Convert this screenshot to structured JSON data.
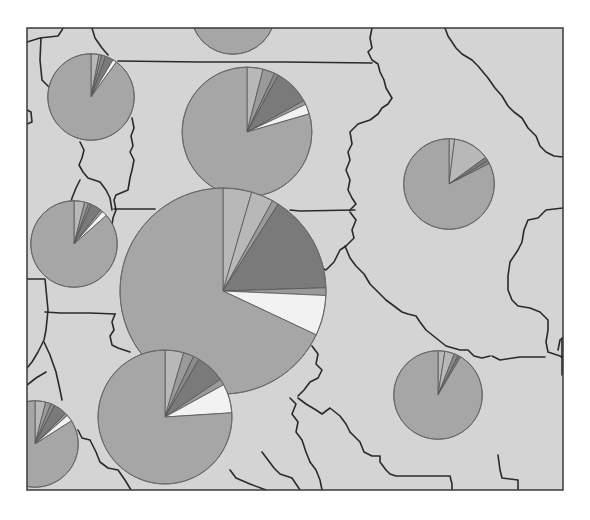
{
  "map": {
    "title": "",
    "background_color": "#d4d4d4",
    "border_color": "#2a2a2a"
  },
  "chart_data": {
    "type": "pie",
    "title": "",
    "legend": [],
    "category_colors": {
      "dominant": "#a6a6a6",
      "light": "#b8b8b8",
      "medium": "#9a9a9a",
      "dark": "#8a8a8a",
      "darker": "#7a7a7a",
      "white": "#f2f2f2"
    },
    "pies": [
      {
        "id": "pie-top-partial",
        "size": 0.41,
        "slices": [
          {
            "category": "dominant",
            "value": 100
          }
        ]
      },
      {
        "id": "pie-northwest",
        "size": 0.42,
        "slices": [
          {
            "category": "light",
            "value": 3
          },
          {
            "category": "medium",
            "value": 1
          },
          {
            "category": "dark",
            "value": 1.5
          },
          {
            "category": "darker",
            "value": 3
          },
          {
            "category": "white",
            "value": 1.5
          },
          {
            "category": "dominant",
            "value": 90
          }
        ]
      },
      {
        "id": "pie-north-center",
        "size": 0.63,
        "slices": [
          {
            "category": "light",
            "value": 4
          },
          {
            "category": "medium",
            "value": 3
          },
          {
            "category": "dark",
            "value": 1
          },
          {
            "category": "darker",
            "value": 9
          },
          {
            "category": "medium",
            "value": 1
          },
          {
            "category": "white",
            "value": 2.5
          },
          {
            "category": "dominant",
            "value": 79.5
          }
        ]
      },
      {
        "id": "pie-east",
        "size": 0.44,
        "slices": [
          {
            "category": "light",
            "value": 2
          },
          {
            "category": "light",
            "value": 13
          },
          {
            "category": "darker",
            "value": 1.5
          },
          {
            "category": "dark",
            "value": 1
          },
          {
            "category": "dominant",
            "value": 82.5
          }
        ]
      },
      {
        "id": "pie-west",
        "size": 0.42,
        "slices": [
          {
            "category": "light",
            "value": 4
          },
          {
            "category": "medium",
            "value": 1.5
          },
          {
            "category": "dark",
            "value": 1
          },
          {
            "category": "darker",
            "value": 4
          },
          {
            "category": "medium",
            "value": 1
          },
          {
            "category": "white",
            "value": 2
          },
          {
            "category": "dominant",
            "value": 86.5
          }
        ]
      },
      {
        "id": "pie-central-large",
        "size": 1.0,
        "slices": [
          {
            "category": "light",
            "value": 4.5
          },
          {
            "category": "light",
            "value": 3.5
          },
          {
            "category": "medium",
            "value": 1
          },
          {
            "category": "darker",
            "value": 15.5
          },
          {
            "category": "medium",
            "value": 1.2
          },
          {
            "category": "white",
            "value": 6.3
          },
          {
            "category": "dominant",
            "value": 68
          }
        ]
      },
      {
        "id": "pie-south-center",
        "size": 0.65,
        "slices": [
          {
            "category": "light",
            "value": 4.5
          },
          {
            "category": "medium",
            "value": 2.5
          },
          {
            "category": "dark",
            "value": 1.5
          },
          {
            "category": "darker",
            "value": 7
          },
          {
            "category": "medium",
            "value": 1.5
          },
          {
            "category": "white",
            "value": 7
          },
          {
            "category": "dominant",
            "value": 76
          }
        ]
      },
      {
        "id": "pie-southeast",
        "size": 0.43,
        "slices": [
          {
            "category": "light",
            "value": 2.5
          },
          {
            "category": "light",
            "value": 3.5
          },
          {
            "category": "dark",
            "value": 1.5
          },
          {
            "category": "darker",
            "value": 1
          },
          {
            "category": "dominant",
            "value": 91.5
          }
        ]
      },
      {
        "id": "pie-southwest-partial",
        "size": 0.42,
        "slices": [
          {
            "category": "light",
            "value": 4
          },
          {
            "category": "medium",
            "value": 2
          },
          {
            "category": "dark",
            "value": 1.5
          },
          {
            "category": "darker",
            "value": 5
          },
          {
            "category": "medium",
            "value": 1
          },
          {
            "category": "white",
            "value": 2.5
          },
          {
            "category": "dominant",
            "value": 84
          }
        ]
      }
    ]
  }
}
